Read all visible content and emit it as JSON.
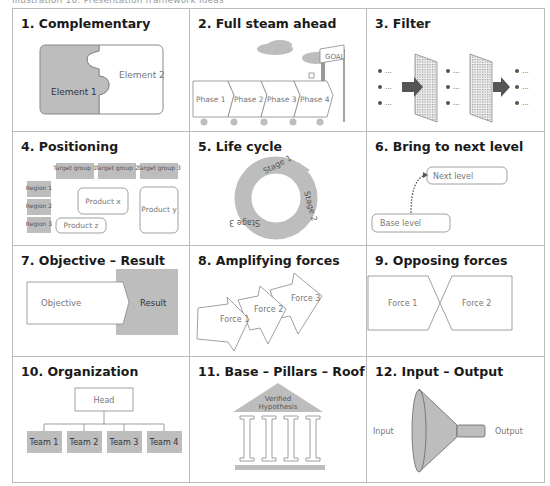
{
  "caption": "Illustration 10: Presentation framework ideas",
  "colors": {
    "gray_fill": "#bdbdbd",
    "dark_fill": "#555555",
    "border": "#bbbbbb",
    "outline": "#888888"
  },
  "panels": [
    {
      "title": "1. Complementary",
      "labels": {
        "element1": "Element 1",
        "element2": "Element 2"
      }
    },
    {
      "title": "2. Full steam ahead",
      "labels": {
        "goal": "GOAL",
        "phases": [
          "Phase 1",
          "Phase 2",
          "Phase 3",
          "Phase 4"
        ]
      }
    },
    {
      "title": "3. Filter",
      "labels": {
        "bullet": "..."
      }
    },
    {
      "title": "4. Positioning",
      "labels": {
        "target_groups": [
          "Target group 1",
          "Target group 2",
          "Target group 3"
        ],
        "regions": [
          "Region 1",
          "Region 2",
          "Region 3"
        ],
        "product_x": "Product x",
        "product_y": "Product y",
        "product_z": "Product z"
      }
    },
    {
      "title": "5. Life cycle",
      "labels": {
        "stages": [
          "Stage 1",
          "Stage 2",
          "Stage 3"
        ]
      }
    },
    {
      "title": "6. Bring to next level",
      "labels": {
        "next": "Next level",
        "base": "Base level"
      }
    },
    {
      "title": "7. Objective – Result",
      "labels": {
        "objective": "Objective",
        "result": "Result"
      }
    },
    {
      "title": "8. Amplifying forces",
      "labels": {
        "forces": [
          "Force 1",
          "Force 2",
          "Force 3"
        ]
      }
    },
    {
      "title": "9. Opposing forces",
      "labels": {
        "force1": "Force 1",
        "force2": "Force 2"
      }
    },
    {
      "title": "10. Organization",
      "labels": {
        "head": "Head",
        "teams": [
          "Team 1",
          "Team 2",
          "Team 3",
          "Team 4"
        ]
      }
    },
    {
      "title": "11. Base – Pillars – Roof",
      "labels": {
        "roof_line1": "Verified",
        "roof_line2": "Hypothesis"
      }
    },
    {
      "title": "12. Input – Output",
      "labels": {
        "input": "Input",
        "output": "Output"
      }
    }
  ]
}
